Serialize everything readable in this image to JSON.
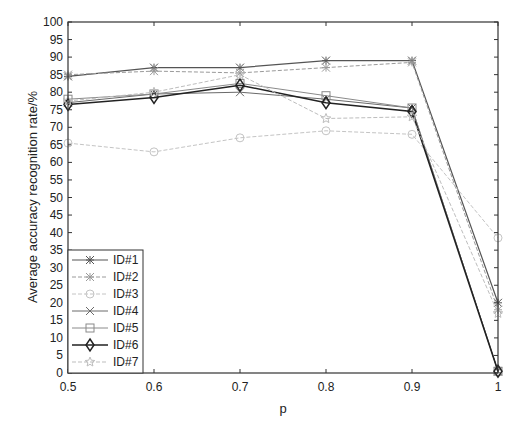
{
  "chart_data": {
    "type": "line",
    "title": "",
    "xlabel": "p",
    "ylabel": "Average accuracy recognition rate/%",
    "x": [
      0.5,
      0.6,
      0.7,
      0.8,
      0.9,
      1.0
    ],
    "xlim": [
      0.5,
      1.0
    ],
    "ylim": [
      0,
      100
    ],
    "xticks": [
      "0.5",
      "0.6",
      "0.7",
      "0.8",
      "0.9",
      "1"
    ],
    "yticks": [
      "0",
      "5",
      "10",
      "15",
      "20",
      "25",
      "30",
      "35",
      "40",
      "45",
      "50",
      "55",
      "60",
      "65",
      "70",
      "75",
      "80",
      "85",
      "90",
      "95",
      "100"
    ],
    "grid": false,
    "legend_position": "lower left",
    "series": [
      {
        "name": "ID#1",
        "marker": "asterisk",
        "color": "#555555",
        "width": 1.2,
        "dash": "",
        "values": [
          84.5,
          87,
          87,
          89,
          89,
          20
        ]
      },
      {
        "name": "ID#2",
        "marker": "asterisk",
        "color": "#9a9a9a",
        "width": 1.0,
        "dash": "4,2",
        "values": [
          85,
          86,
          85.5,
          87,
          88.5,
          18
        ]
      },
      {
        "name": "ID#3",
        "marker": "circle",
        "color": "#c4c4c4",
        "width": 1.0,
        "dash": "4,2",
        "values": [
          65.5,
          63,
          67,
          69,
          68,
          38.5
        ]
      },
      {
        "name": "ID#4",
        "marker": "x",
        "color": "#6a6a6a",
        "width": 1.0,
        "dash": "",
        "values": [
          77,
          79.5,
          80,
          78,
          75.5,
          0.5
        ]
      },
      {
        "name": "ID#5",
        "marker": "square",
        "color": "#8a8a8a",
        "width": 1.0,
        "dash": "",
        "values": [
          78,
          79.5,
          82.5,
          79,
          75.5,
          0.5
        ]
      },
      {
        "name": "ID#6",
        "marker": "diamond",
        "color": "#222222",
        "width": 1.6,
        "dash": "",
        "values": [
          76.5,
          78.5,
          82,
          77,
          74.5,
          0.5
        ]
      },
      {
        "name": "ID#7",
        "marker": "star",
        "color": "#bdbdbd",
        "width": 1.0,
        "dash": "4,2",
        "values": [
          77.5,
          80,
          85,
          72.5,
          73,
          17
        ]
      }
    ]
  }
}
